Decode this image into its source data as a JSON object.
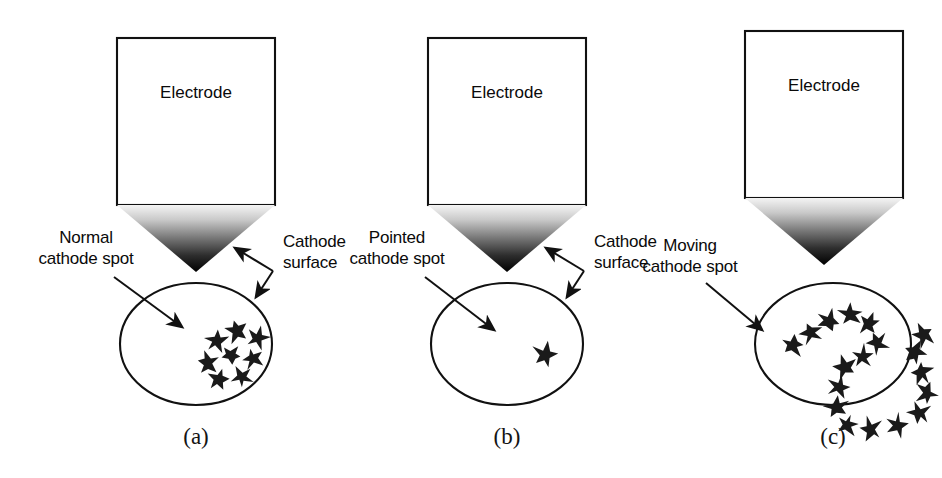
{
  "figure": {
    "background_color": "#ffffff",
    "stroke_color": "#111111",
    "star_color": "#1a1a1a",
    "gradient_top_color": "#f2f2f2",
    "gradient_bottom_color": "#000000",
    "panel_count": 3
  },
  "panels": [
    {
      "id": "a",
      "caption": "(a)",
      "electrode_label": "Electrode",
      "spot_label_line1": "Normal",
      "spot_label_line2": "cathode spot",
      "surface_label_line1": "Cathode",
      "surface_label_line2": "surface",
      "has_surface_label": true,
      "spot_count": 8,
      "spot_pattern": "compact-cluster",
      "stars": [
        {
          "cx": 96,
          "cy": 58,
          "r": 12,
          "rot": 8
        },
        {
          "cx": 117,
          "cy": 48,
          "r": 12,
          "rot": -14
        },
        {
          "cx": 138,
          "cy": 55,
          "r": 11,
          "rot": 20
        },
        {
          "cx": 88,
          "cy": 80,
          "r": 12,
          "rot": -6
        },
        {
          "cx": 111,
          "cy": 72,
          "r": 11,
          "rot": 30
        },
        {
          "cx": 133,
          "cy": 76,
          "r": 11,
          "rot": -20
        },
        {
          "cx": 99,
          "cy": 96,
          "r": 12,
          "rot": 16
        },
        {
          "cx": 122,
          "cy": 94,
          "r": 11,
          "rot": -28
        }
      ]
    },
    {
      "id": "b",
      "caption": "(b)",
      "electrode_label": "Electrode",
      "spot_label_line1": "Pointed",
      "spot_label_line2": "cathode spot",
      "surface_label_line1": "Cathode",
      "surface_label_line2": "surface",
      "has_surface_label": true,
      "spot_count": 1,
      "spot_pattern": "single-point",
      "stars": [
        {
          "cx": 114,
          "cy": 72,
          "r": 13,
          "rot": 12
        }
      ]
    },
    {
      "id": "c",
      "caption": "(c)",
      "electrode_label": "Electrode",
      "spot_label_line1": "Moving",
      "spot_label_line2": "cathode spot",
      "surface_label_line1": "",
      "surface_label_line2": "",
      "has_surface_label": false,
      "spot_count": 20,
      "spot_pattern": "moving-loop-trail",
      "stars": [
        {
          "cx": 38,
          "cy": 62,
          "r": 12,
          "rot": 10
        },
        {
          "cx": 56,
          "cy": 50,
          "r": 12,
          "rot": -18
        },
        {
          "cx": 74,
          "cy": 38,
          "r": 12,
          "rot": 24
        },
        {
          "cx": 95,
          "cy": 32,
          "r": 12,
          "rot": -8
        },
        {
          "cx": 114,
          "cy": 40,
          "r": 12,
          "rot": 16
        },
        {
          "cx": 122,
          "cy": 60,
          "r": 12,
          "rot": -24
        },
        {
          "cx": 108,
          "cy": 74,
          "r": 12,
          "rot": 6
        },
        {
          "cx": 90,
          "cy": 84,
          "r": 12,
          "rot": -12
        },
        {
          "cx": 84,
          "cy": 104,
          "r": 12,
          "rot": 22
        },
        {
          "cx": 82,
          "cy": 124,
          "r": 12,
          "rot": -6
        },
        {
          "cx": 92,
          "cy": 142,
          "r": 12,
          "rot": 14
        },
        {
          "cx": 116,
          "cy": 146,
          "r": 12,
          "rot": -20
        },
        {
          "cx": 142,
          "cy": 142,
          "r": 12,
          "rot": 8
        },
        {
          "cx": 164,
          "cy": 130,
          "r": 12,
          "rot": -16
        },
        {
          "cx": 172,
          "cy": 110,
          "r": 12,
          "rot": 26
        },
        {
          "cx": 166,
          "cy": 90,
          "r": 12,
          "rot": -10
        },
        {
          "cx": 160,
          "cy": 70,
          "r": 12,
          "rot": 18
        },
        {
          "cx": 168,
          "cy": 52,
          "r": 12,
          "rot": -26
        }
      ]
    }
  ],
  "geometry": {
    "electrode_box": {
      "x": 22,
      "y": 14,
      "w": 158,
      "h": 167
    },
    "electrode_tip_apex_y": 248,
    "ellipse": {
      "cx": 100,
      "cy": 84,
      "rx": 76,
      "ry": 61
    }
  }
}
